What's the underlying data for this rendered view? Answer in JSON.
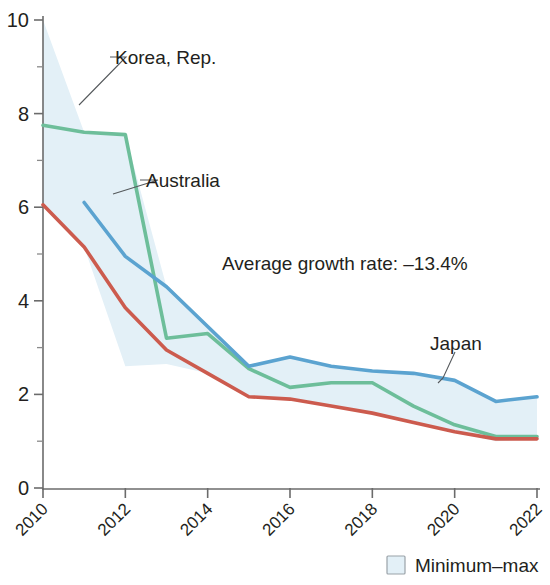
{
  "chart_data": {
    "type": "line",
    "title": "",
    "subtitle": "",
    "xlabel": "",
    "ylabel": "",
    "x": [
      2010,
      2011,
      2012,
      2013,
      2014,
      2015,
      2016,
      2017,
      2018,
      2019,
      2020,
      2021,
      2022
    ],
    "xlim": [
      2010,
      2022
    ],
    "ylim": [
      0,
      10
    ],
    "yticks": [
      0,
      2,
      4,
      6,
      8,
      10
    ],
    "ytick_labels": [
      "0",
      "2",
      "4",
      "6",
      "8",
      "10"
    ],
    "xticks": [
      2010,
      2012,
      2014,
      2016,
      2018,
      2020,
      2022
    ],
    "xtick_labels": [
      "2010",
      "2012",
      "2014",
      "2016",
      "2018",
      "2020",
      "2022"
    ],
    "xtick_minor": [
      2011,
      2013,
      2015,
      2017,
      2019,
      2021
    ],
    "grid": false,
    "legend_position": "bottom-right",
    "series": [
      {
        "name": "Korea, Rep.",
        "color": "#deb košt",
        "values": [
          10.0,
          7.6,
          2.6,
          2.65,
          2.9,
          2.5,
          2.35,
          2.3,
          2.0,
          1.7,
          1.3,
          1.0,
          1.4
        ]
      },
      {
        "name": "Australia",
        "color": "#6dbe9a",
        "values": [
          7.75,
          7.6,
          7.55,
          3.2,
          3.3,
          2.55,
          2.15,
          2.25,
          2.25,
          1.75,
          1.35,
          1.1,
          1.1
        ]
      },
      {
        "name": "Japan",
        "color": "#5ba3d0",
        "values": [
          null,
          6.1,
          4.95,
          4.3,
          3.45,
          2.6,
          2.8,
          2.6,
          2.5,
          2.45,
          2.3,
          1.85,
          1.95
        ]
      },
      {
        "name": "",
        "color": "#cc5b4e",
        "values": [
          6.05,
          5.15,
          3.85,
          2.95,
          2.45,
          1.95,
          1.9,
          1.75,
          1.6,
          1.4,
          1.2,
          1.05,
          1.05
        ]
      }
    ],
    "band": {
      "name": "Minimum–max",
      "color": "#e3f0f7",
      "min": [
        6.05,
        5.15,
        2.6,
        2.65,
        2.45,
        1.95,
        1.9,
        1.75,
        1.6,
        1.4,
        1.2,
        1.0,
        1.05
      ],
      "max": [
        10.0,
        7.6,
        7.55,
        4.3,
        3.45,
        2.6,
        2.8,
        2.6,
        2.5,
        2.45,
        2.3,
        1.85,
        1.95
      ]
    },
    "annotations": [
      {
        "id": "growth-rate",
        "text": "Average growth rate: –13.4%"
      }
    ],
    "callouts": [
      {
        "id": "korea",
        "text": "Korea, Rep."
      },
      {
        "id": "australia",
        "text": "Australia"
      },
      {
        "id": "japan",
        "text": "Japan"
      }
    ]
  },
  "legend": {
    "items": [
      {
        "label": "Minimum–max",
        "color": "#e3f0f7"
      }
    ]
  },
  "colors": {
    "korea": "#deb84c",
    "australia": "#6dbe9a",
    "japan": "#5ba3d0",
    "fourth": "#cc5b4e",
    "band": "#e3f0f7",
    "axis": "#6b6b6b",
    "text": "#231f20"
  }
}
